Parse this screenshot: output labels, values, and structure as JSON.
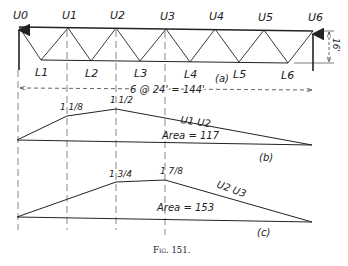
{
  "figure": {
    "caption": "Fig. 151.",
    "truss": {
      "part_label": "(a)",
      "upper_nodes": [
        "U0",
        "U1",
        "U2",
        "U3",
        "U4",
        "U5",
        "U6"
      ],
      "lower_nodes": [
        "L1",
        "L2",
        "L3",
        "L4",
        "L5",
        "L6"
      ],
      "span_dimension": "6 @ 24' = 144'",
      "height_dimension": "16'"
    },
    "influence_b": {
      "part_label": "(b)",
      "member": "U1 U2",
      "area_label": "Area = 117",
      "ordinate_1": "1 1/8",
      "ordinate_2": "1 1/2"
    },
    "influence_c": {
      "part_label": "(c)",
      "member": "U2 U3",
      "area_label": "Area = 153",
      "ordinate_1": "1 3/4",
      "ordinate_2": "1 7/8"
    }
  }
}
